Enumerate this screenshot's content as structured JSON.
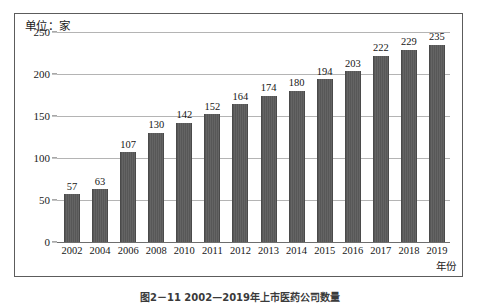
{
  "chart_data": {
    "type": "bar",
    "title": "",
    "unit_label": "单位：家",
    "xlabel": "年份",
    "ylabel": "",
    "ylim": [
      0,
      250
    ],
    "yticks": [
      0,
      50,
      100,
      150,
      200,
      250
    ],
    "grid": true,
    "legend": "none",
    "categories": [
      "2002",
      "2004",
      "2006",
      "2008",
      "2010",
      "2011",
      "2012",
      "2013",
      "2014",
      "2015",
      "2016",
      "2017",
      "2018",
      "2019"
    ],
    "values": [
      57,
      63,
      107,
      130,
      142,
      152,
      164,
      174,
      180,
      194,
      203,
      222,
      229,
      235
    ],
    "bar_color": "#5b5b5b",
    "gridline_color": "#b4b4b4",
    "axis_color": "#6e6e6e",
    "frame_color": "#5c5c5c",
    "background_color": "#ffffff"
  },
  "figure": {
    "caption": "图2－11  2002—2019年上市医药公司数量"
  }
}
